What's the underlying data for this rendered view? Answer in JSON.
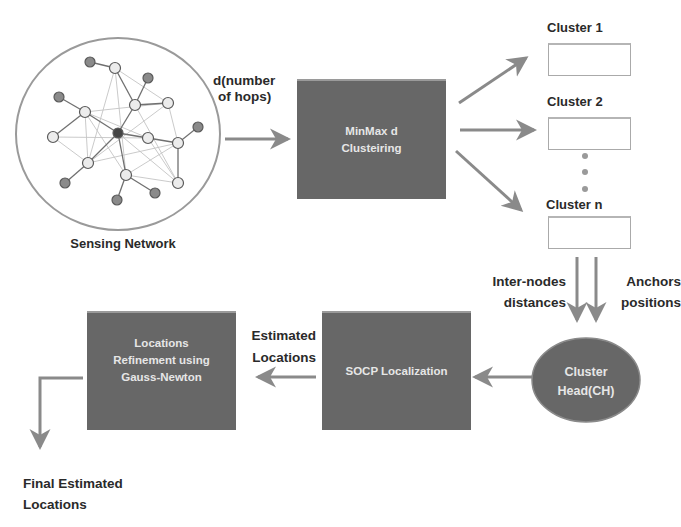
{
  "network": {
    "label": "Sensing Network",
    "hops_label_line1": "d(number",
    "hops_label_line2": "of hops)"
  },
  "clustering_box": {
    "line1": "MinMax d",
    "line2": "Clusteiring"
  },
  "clusters": [
    {
      "label": "Cluster 1"
    },
    {
      "label": "Cluster 2"
    },
    {
      "label": "Cluster n"
    }
  ],
  "cluster_inputs": {
    "left_line1": "Inter-nodes",
    "left_line2": "distances",
    "right_line1": "Anchors",
    "right_line2": "positions"
  },
  "cluster_head": {
    "line1": "Cluster",
    "line2": "Head(CH)"
  },
  "socp_box": {
    "label": "SOCP Localization"
  },
  "estimated": {
    "line1": "Estimated",
    "line2": "Locations"
  },
  "refinement_box": {
    "line1": "Locations",
    "line2": "Refinement using",
    "line3": "Gauss-Newton"
  },
  "final": {
    "line1": "Final Estimated",
    "line2": "Locations"
  },
  "colors": {
    "box_fill": "#676767",
    "arrow": "#8a8a8a",
    "node_dark": "#7a7a7a",
    "node_light": "#e8e8e8"
  }
}
